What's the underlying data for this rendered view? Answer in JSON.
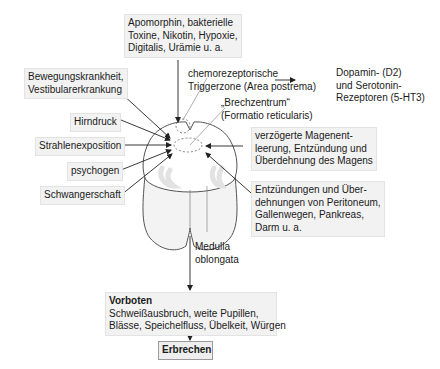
{
  "diagram": {
    "top_box": {
      "lines": [
        "Apomorphin, bakterielle",
        "Toxine, Nikotin, Hypoxie,",
        "Digitalis, Urämie u. a."
      ]
    },
    "left_triggers": [
      {
        "lines": [
          "Bewegungskrankheit,",
          "Vestibularerkrankung"
        ]
      },
      {
        "lines": [
          "Hirndruck"
        ]
      },
      {
        "lines": [
          "Strahlenexposition"
        ]
      },
      {
        "lines": [
          "psychogen"
        ]
      },
      {
        "lines": [
          "Schwangerschaft"
        ]
      }
    ],
    "ctz_label": {
      "lines": [
        "chemorezeptorische",
        "Triggerzone (Area postrema)"
      ]
    },
    "receptors_label": {
      "lines": [
        "Dopamin- (D2)",
        "und Serotonin-",
        "Rezeptoren (5-HT3)"
      ]
    },
    "vomiting_center_label": {
      "lines": [
        "„Brechzentrum“",
        "(Formatio reticularis)"
      ]
    },
    "right_triggers": [
      {
        "lines": [
          "verzögerte Magenent-",
          "leerung, Entzündung und",
          "Überdehnung des Magens"
        ]
      },
      {
        "lines": [
          "Entzündungen und Über-",
          "dehnungen von Peritoneum,",
          "Gallenwegen, Pankreas,",
          "Darm u. a."
        ]
      }
    ],
    "medulla_label": {
      "lines": [
        "Medulla",
        "oblongata"
      ]
    },
    "prodromes_box": {
      "heading": "Vorboten",
      "lines": [
        "Schweißausbruch, weite Pupillen,",
        "Blässe, Speichelfluss, Übelkeit, Würgen"
      ]
    },
    "result_box": {
      "label": "Erbrechen"
    },
    "colors": {
      "box_fill": "#f2f2f2",
      "box_border": "#e3e3e3",
      "line": "#333333",
      "medulla_fill": "#ffffff",
      "medulla_lower_fill": "#f4f4f4",
      "gray_matter": "#e6e6e6"
    }
  }
}
